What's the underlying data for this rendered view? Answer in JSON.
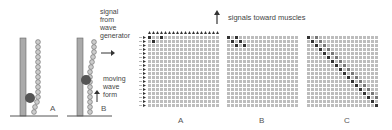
{
  "panels_left": {
    "panel_a_label": "A",
    "panel_b_label": "B",
    "signal_text": "signal\nfrom\nwave\ngenerator",
    "moving_text": "moving\nwave\nform"
  },
  "top_text": "signals toward muscles",
  "grids": [
    {
      "label": "A",
      "size": 18,
      "active": [
        [
          0,
          0
        ],
        [
          0,
          3
        ],
        [
          1,
          1
        ]
      ]
    },
    {
      "label": "B",
      "size": 18,
      "active": [
        [
          0,
          0
        ],
        [
          0,
          2
        ],
        [
          1,
          1
        ],
        [
          1,
          3
        ],
        [
          2,
          2
        ],
        [
          2,
          4
        ]
      ]
    },
    {
      "label": "C",
      "size": 18,
      "diagonal": true
    }
  ],
  "colors": {
    "cell": "#bdbdbd",
    "active": "#333333"
  }
}
